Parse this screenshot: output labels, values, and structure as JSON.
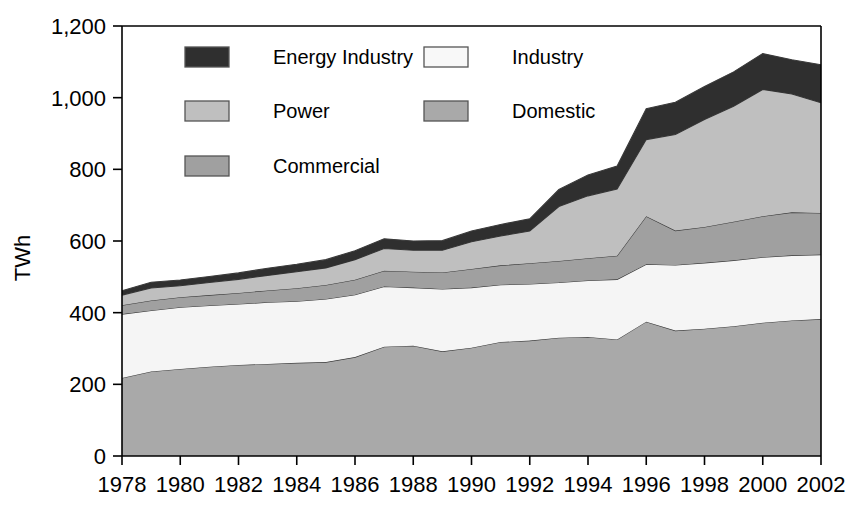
{
  "chart_data": {
    "type": "area",
    "title": "",
    "subtitle": "",
    "xlabel": "",
    "ylabel": "TWh",
    "stacked": true,
    "grid": false,
    "legend_position": "top-inside",
    "xlim": [
      1978,
      2002
    ],
    "ylim": [
      0,
      1200
    ],
    "ytick_labels": [
      "0",
      "200",
      "400",
      "600",
      "800",
      "1,000",
      "1,200"
    ],
    "ytick_values": [
      0,
      200,
      400,
      600,
      800,
      1000,
      1200
    ],
    "xtick_labels": [
      "1978",
      "1980",
      "1982",
      "1984",
      "1986",
      "1988",
      "1990",
      "1992",
      "1994",
      "1996",
      "1998",
      "2000",
      "2002"
    ],
    "xtick_values": [
      1978,
      1980,
      1982,
      1984,
      1986,
      1988,
      1990,
      1992,
      1994,
      1996,
      1998,
      2000,
      2002
    ],
    "x": [
      1978,
      1979,
      1980,
      1981,
      1982,
      1983,
      1984,
      1985,
      1986,
      1987,
      1988,
      1989,
      1990,
      1991,
      1992,
      1993,
      1994,
      1995,
      1996,
      1997,
      1998,
      1999,
      2000,
      2001,
      2002
    ],
    "stack_order_bottom_to_top": [
      "Domestic",
      "Industry",
      "Commercial",
      "Power",
      "Energy Industry"
    ],
    "series": [
      {
        "name": "Domestic",
        "color": "#a9a9a9",
        "values": [
          218,
          236,
          243,
          249,
          254,
          257,
          260,
          262,
          276,
          305,
          308,
          292,
          302,
          318,
          322,
          330,
          332,
          325,
          375,
          350,
          355,
          362,
          372,
          378,
          382
        ]
      },
      {
        "name": "Industry",
        "color": "#f5f5f5",
        "values": [
          178,
          170,
          172,
          171,
          170,
          172,
          172,
          176,
          174,
          168,
          162,
          174,
          168,
          160,
          158,
          154,
          158,
          168,
          160,
          183,
          184,
          184,
          183,
          182,
          180
        ]
      },
      {
        "name": "Commercial",
        "color": "#a0a0a0",
        "values": [
          25,
          28,
          28,
          29,
          31,
          33,
          36,
          39,
          42,
          44,
          44,
          46,
          52,
          54,
          58,
          60,
          62,
          66,
          134,
          96,
          100,
          108,
          114,
          120,
          116
        ]
      },
      {
        "name": "Power",
        "color": "#bfbfbf",
        "values": [
          28,
          35,
          32,
          35,
          38,
          42,
          46,
          48,
          56,
          62,
          60,
          62,
          76,
          82,
          90,
          152,
          174,
          186,
          214,
          268,
          300,
          322,
          354,
          330,
          308
        ]
      },
      {
        "name": "Energy Industry",
        "color": "#2f2f2f",
        "values": [
          12,
          16,
          16,
          17,
          18,
          20,
          21,
          23,
          25,
          27,
          26,
          27,
          30,
          32,
          34,
          48,
          58,
          64,
          86,
          90,
          92,
          96,
          100,
          96,
          106
        ]
      }
    ],
    "totals": [
      461,
      485,
      491,
      501,
      511,
      524,
      535,
      548,
      573,
      606,
      600,
      601,
      628,
      646,
      662,
      744,
      784,
      809,
      969,
      987,
      1031,
      1072,
      1103,
      1106,
      1092
    ]
  },
  "legend": {
    "items": [
      {
        "label": "Energy Industry",
        "color": "#2f2f2f",
        "column": 0,
        "row": 0
      },
      {
        "label": "Power",
        "color": "#bfbfbf",
        "column": 0,
        "row": 1
      },
      {
        "label": "Commercial",
        "color": "#a0a0a0",
        "column": 0,
        "row": 2
      },
      {
        "label": "Industry",
        "color": "#f8f8f8",
        "column": 1,
        "row": 0
      },
      {
        "label": "Domestic",
        "color": "#a9a9a9",
        "column": 1,
        "row": 1
      }
    ]
  },
  "axes": {
    "y_axis_title": "TWh"
  }
}
